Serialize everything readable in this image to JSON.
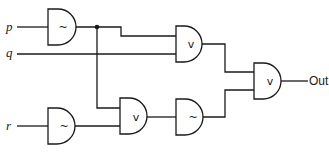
{
  "diagram": {
    "type": "logic-circuit",
    "inputs": [
      {
        "id": "p",
        "label": "p"
      },
      {
        "id": "q",
        "label": "q"
      },
      {
        "id": "r",
        "label": "r"
      }
    ],
    "output": {
      "id": "out",
      "label": "Out"
    },
    "gates": [
      {
        "id": "g1",
        "kind": "NOT",
        "symbol": "~",
        "inputs": [
          "p"
        ]
      },
      {
        "id": "g2",
        "kind": "OR",
        "symbol": "v",
        "inputs": [
          "g1",
          "q"
        ]
      },
      {
        "id": "g3",
        "kind": "NOT",
        "symbol": "~",
        "inputs": [
          "r"
        ]
      },
      {
        "id": "g4",
        "kind": "OR",
        "symbol": "v",
        "inputs": [
          "g1",
          "g3"
        ]
      },
      {
        "id": "g5",
        "kind": "NOT",
        "symbol": "~",
        "inputs": [
          "g4"
        ]
      },
      {
        "id": "g6",
        "kind": "OR",
        "symbol": "v",
        "inputs": [
          "g2",
          "g5"
        ]
      }
    ],
    "colors": {
      "stroke": "#1a1a1a",
      "background": "#ffffff"
    }
  }
}
